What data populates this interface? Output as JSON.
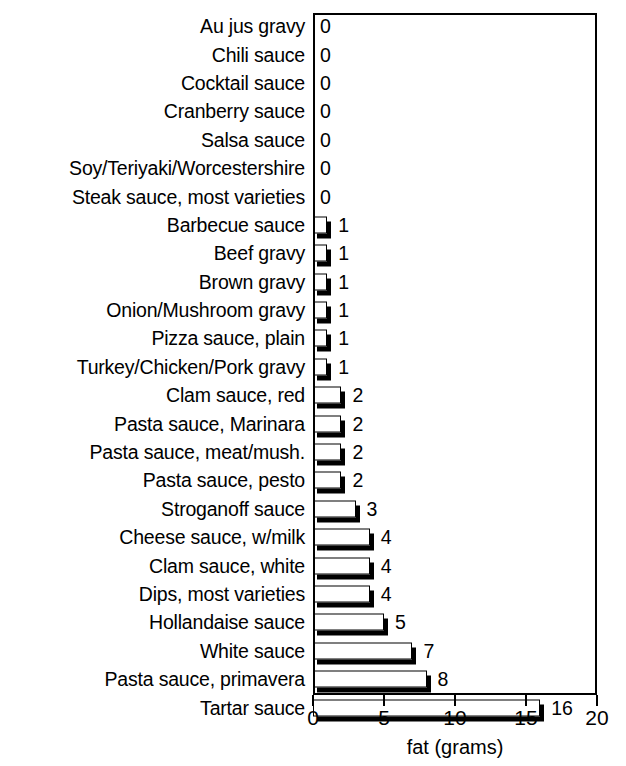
{
  "chart_data": {
    "type": "bar",
    "orientation": "horizontal",
    "title": "",
    "xlabel": "fat (grams)",
    "ylabel": "",
    "xlim": [
      0,
      20
    ],
    "xticks": [
      0,
      5,
      10,
      15,
      20
    ],
    "xtick_labels": [
      "0",
      "5",
      "10",
      "15",
      "20"
    ],
    "grid": false,
    "legend": false,
    "categories": [
      "Au jus gravy",
      "Chili sauce",
      "Cocktail sauce",
      "Cranberry sauce",
      "Salsa sauce",
      "Soy/Teriyaki/Worcestershire",
      "Steak sauce, most varieties",
      "Barbecue sauce",
      "Beef gravy",
      "Brown gravy",
      "Onion/Mushroom gravy",
      "Pizza sauce, plain",
      "Turkey/Chicken/Pork gravy",
      "Clam sauce, red",
      "Pasta sauce, Marinara",
      "Pasta sauce, meat/mush.",
      "Pasta sauce, pesto",
      "Stroganoff sauce",
      "Cheese sauce, w/milk",
      "Clam sauce, white",
      "Dips, most varieties",
      "Hollandaise sauce",
      "White sauce",
      "Pasta sauce, primavera",
      "Tartar sauce"
    ],
    "values": [
      0,
      0,
      0,
      0,
      0,
      0,
      0,
      1,
      1,
      1,
      1,
      1,
      1,
      2,
      2,
      2,
      2,
      3,
      4,
      4,
      4,
      5,
      7,
      8,
      16
    ],
    "value_labels": [
      "0",
      "0",
      "0",
      "0",
      "0",
      "0",
      "0",
      "1",
      "1",
      "1",
      "1",
      "1",
      "1",
      "2",
      "2",
      "2",
      "2",
      "3",
      "4",
      "4",
      "4",
      "5",
      "7",
      "8",
      "16"
    ],
    "colors": {
      "bar_face": "#ffffff",
      "bar_edge": "#000000",
      "bar_shadow": "#000000",
      "axis": "#000000",
      "text": "#000000",
      "background": "#ffffff"
    }
  }
}
